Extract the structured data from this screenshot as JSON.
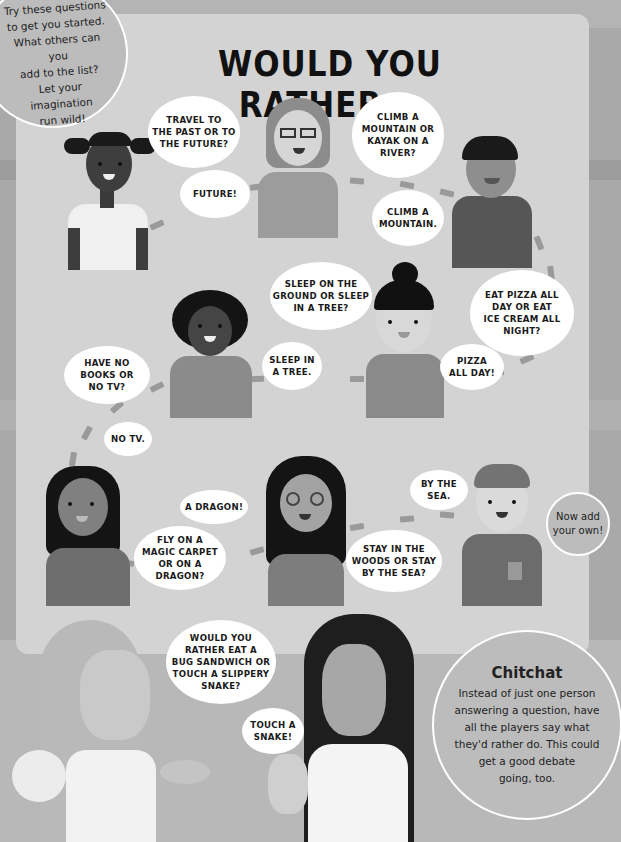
{
  "page": {
    "title": "WOULD YOU RATHER...",
    "intro_note": [
      "Try these questions",
      "to get you started.",
      "What others can you",
      "add to the list?",
      "Let your imagination",
      "run wild!"
    ],
    "add_own_note": [
      "Now add",
      "your own!"
    ],
    "chitchat": {
      "title": "Chitchat",
      "lines": [
        "Instead of just one person",
        "answering a question, have",
        "all the players say what",
        "they'd rather do. This could",
        "get a good debate",
        "going, too."
      ]
    }
  },
  "bubbles": {
    "q1": [
      "TRAVEL TO",
      "THE PAST OR TO",
      "THE FUTURE?"
    ],
    "a1": [
      "FUTURE!"
    ],
    "q2": [
      "CLIMB A",
      "MOUNTAIN OR",
      "KAYAK ON A",
      "RIVER?"
    ],
    "a2": [
      "CLIMB A",
      "MOUNTAIN."
    ],
    "q3": [
      "EAT PIZZA ALL",
      "DAY OR EAT",
      "ICE CREAM ALL",
      "NIGHT?"
    ],
    "a3": [
      "PIZZA",
      "ALL DAY!"
    ],
    "q4": [
      "SLEEP ON THE",
      "GROUND OR SLEEP",
      "IN A TREE?"
    ],
    "a4": [
      "SLEEP IN",
      "A TREE."
    ],
    "q5": [
      "HAVE NO",
      "BOOKS OR",
      "NO TV?"
    ],
    "a5": [
      "NO TV."
    ],
    "q6": [
      "FLY ON A",
      "MAGIC CARPET",
      "OR ON A",
      "DRAGON?"
    ],
    "a6": [
      "A DRAGON!"
    ],
    "q7": [
      "STAY IN THE",
      "WOODS OR STAY",
      "BY THE SEA?"
    ],
    "a7": [
      "BY THE",
      "SEA."
    ],
    "q8": [
      "WOULD YOU",
      "RATHER EAT A",
      "BUG SANDWICH OR",
      "TOUCH A SLIPPERY",
      "SNAKE?"
    ],
    "a8": [
      "TOUCH A",
      "SNAKE!"
    ]
  },
  "colors": {
    "page_bg": "#a9a9a9",
    "panel_bg": "#d3d3d3",
    "bubble_bg": "#ffffff",
    "path_dash": "#9a9a9a",
    "title_text": "#111111"
  }
}
